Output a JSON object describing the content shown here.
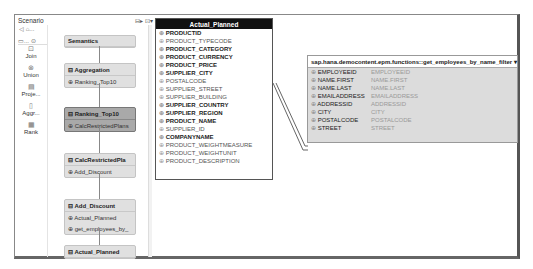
{
  "scenario": {
    "title": "Scenario",
    "nav": "◁ ⌂...",
    "nav2": "▭...  ⊙",
    "palette": [
      {
        "icon": "⊡",
        "label": "Join"
      },
      {
        "icon": "⊗",
        "label": "Union"
      },
      {
        "icon": "▤",
        "label": "Proje..."
      },
      {
        "icon": "▯",
        "label": "Aggr..."
      },
      {
        "icon": "▦",
        "label": "Rank"
      }
    ],
    "header_icons": "⊟▸ ⊡▾",
    "nodes": [
      {
        "title": "Semantics",
        "rows": [],
        "selected": false,
        "top": 10
      },
      {
        "title": "⊟ Aggregation",
        "rows": [
          "⊕ Ranking_Top10"
        ],
        "selected": false,
        "top": 38
      },
      {
        "title": "⊟ Ranking_Top10",
        "rows": [
          "⊕ CalcRestrictedPlans"
        ],
        "selected": true,
        "top": 82
      },
      {
        "title": "⊟ CalcRestrictedPla",
        "rows": [
          "⊕ Add_Discount"
        ],
        "selected": false,
        "top": 128
      },
      {
        "title": "⊟ Add_Discount",
        "rows": [
          "⊕ Actual_Planned",
          "⊕ get_employees_by_"
        ],
        "selected": false,
        "top": 174
      },
      {
        "title": "⊟ Actual_Planned",
        "rows": [],
        "selected": false,
        "top": 220
      }
    ]
  },
  "details": {
    "title": "Details",
    "table": {
      "title": "Actual_Planned",
      "rows": [
        {
          "n": "PRODUCTID",
          "b": true
        },
        {
          "n": "PRODUCT_TYPECODE",
          "b": false
        },
        {
          "n": "PRODUCT_CATEGORY",
          "b": true
        },
        {
          "n": "PRODUCT_CURRENCY",
          "b": true
        },
        {
          "n": "PRODUCT_PRICE",
          "b": true
        },
        {
          "n": "SUPPLIER_CITY",
          "b": true
        },
        {
          "n": "POSTALCODE",
          "b": false
        },
        {
          "n": "SUPPLIER_STREET",
          "b": false
        },
        {
          "n": "SUPPLIER_BUILDING",
          "b": false
        },
        {
          "n": "SUPPLIER_COUNTRY",
          "b": true
        },
        {
          "n": "SUPPLIER_REGION",
          "b": true
        },
        {
          "n": "PRODUCT_NAME",
          "b": true
        },
        {
          "n": "SUPPLIER_ID",
          "b": false
        },
        {
          "n": "COMPANYNAME",
          "b": true
        },
        {
          "n": "PRODUCT_WEIGHTMEASURE",
          "b": false
        },
        {
          "n": "PRODUCT_WEIGHTUNIT",
          "b": false
        },
        {
          "n": "PRODUCT_DESCRIPTION",
          "b": false
        }
      ]
    },
    "function": {
      "title": "sap.hana.democontent.epm.functions::get_employees_by_name_filter ▾",
      "rows": [
        {
          "a": "EMPLOYEEID",
          "b": "EMPLOYEEID"
        },
        {
          "a": "NAME.FIRST",
          "b": "NAME.FIRST"
        },
        {
          "a": "NAME.LAST",
          "b": "NAME.LAST"
        },
        {
          "a": "EMAILADDRESS",
          "b": "EMAILADDRESS"
        },
        {
          "a": "ADDRESSID",
          "b": "ADDRESSID"
        },
        {
          "a": "CITY",
          "b": "CITY"
        },
        {
          "a": "POSTALCODE",
          "b": "POSTALCODE"
        },
        {
          "a": "STREET",
          "b": "STREET"
        }
      ]
    }
  }
}
